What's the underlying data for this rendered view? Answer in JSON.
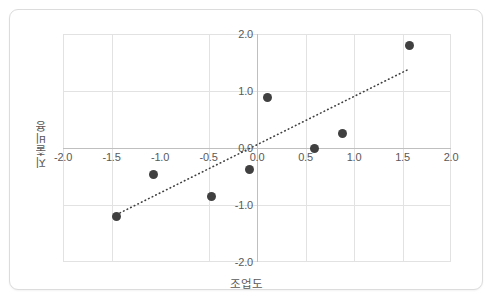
{
  "chart_data": {
    "type": "scatter",
    "title": "",
    "xlabel": "조업도",
    "ylabel": "지출비용",
    "xlim": [
      -2.0,
      2.0
    ],
    "ylim": [
      -2.0,
      2.0
    ],
    "grid": true,
    "legend": "none",
    "xticks": [
      "-2.0",
      "-1.5",
      "-1.0",
      "-0.5",
      "0.0",
      "0.5",
      "1.0",
      "1.5",
      "2.0"
    ],
    "xtick_values": [
      -2.0,
      -1.5,
      -1.0,
      -0.5,
      0.0,
      0.5,
      1.0,
      1.5,
      2.0
    ],
    "yticks": [
      "2.0",
      "1.0",
      "0.0",
      "-1.0",
      "-2.0"
    ],
    "ytick_values": [
      2.0,
      1.0,
      0.0,
      -1.0,
      -2.0
    ],
    "gridline_x_values": [
      -1.5,
      -0.5,
      0.5,
      1.0,
      1.5
    ],
    "gridline_y_values": [
      1.0,
      -1.0
    ],
    "axis_x_value": 0.0,
    "axis_y_value": 0.0,
    "marker_color": "#404040",
    "grid_color": "#e2e2e2",
    "axis_color": "#bfbfbf",
    "tick_label_color": "#595959",
    "points": [
      {
        "x": -1.45,
        "y": -1.2
      },
      {
        "x": -1.07,
        "y": -0.46
      },
      {
        "x": -0.47,
        "y": -0.85
      },
      {
        "x": -0.08,
        "y": -0.37
      },
      {
        "x": 0.11,
        "y": 0.89
      },
      {
        "x": 0.59,
        "y": 0.0
      },
      {
        "x": 0.88,
        "y": 0.25
      },
      {
        "x": 1.57,
        "y": 1.79
      }
    ],
    "trendline": {
      "style": "dotted",
      "color": "#3f3f3f",
      "x0": -1.45,
      "y0": -1.17,
      "x1": 1.55,
      "y1": 1.37
    }
  }
}
